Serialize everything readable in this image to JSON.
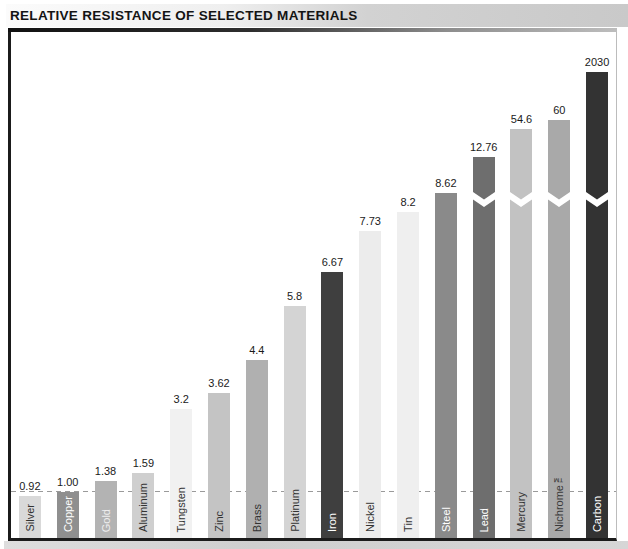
{
  "title": "RELATIVE RESISTANCE OF SELECTED MATERIALS",
  "chart_data": {
    "type": "bar",
    "title": "RELATIVE RESISTANCE OF SELECTED MATERIALS",
    "xlabel": "",
    "ylabel": "",
    "grid": false,
    "legend": "none",
    "reference_line": {
      "value": 1.0,
      "style": "dashed",
      "color": "#9a9a9a"
    },
    "axis_break_note": "bars taller than the frame are drawn with a white zigzag break symbol",
    "categories": [
      "Silver",
      "Copper",
      "Gold",
      "Aluminum",
      "Tungsten",
      "Zinc",
      "Brass",
      "Platinum",
      "Iron",
      "Nickel",
      "Tin",
      "Steel",
      "Lead",
      "Mercury",
      "Nichrome™",
      "Carbon"
    ],
    "values": [
      0.92,
      1.0,
      1.38,
      1.59,
      3.2,
      3.62,
      4.4,
      5.8,
      6.67,
      7.73,
      8.2,
      8.62,
      12.76,
      54.6,
      60,
      2030
    ],
    "bars": [
      {
        "name": "Silver",
        "value_label": "0.92",
        "color": "#d9d9d9",
        "label_color": "#333333",
        "height_px": 42,
        "axis_break": false
      },
      {
        "name": "Copper",
        "value_label": "1.00",
        "color": "#8f8f8f",
        "label_color": "#ffffff",
        "height_px": 46,
        "axis_break": false
      },
      {
        "name": "Gold",
        "value_label": "1.38",
        "color": "#b3b3b3",
        "label_color": "#eeeeee",
        "height_px": 57,
        "axis_break": false
      },
      {
        "name": "Aluminum",
        "value_label": "1.59",
        "color": "#cfcfcf",
        "label_color": "#333333",
        "height_px": 65,
        "axis_break": false
      },
      {
        "name": "Tungsten",
        "value_label": "3.2",
        "color": "#f1f1f1",
        "label_color": "#333333",
        "height_px": 129,
        "axis_break": false
      },
      {
        "name": "Zinc",
        "value_label": "3.62",
        "color": "#c4c4c4",
        "label_color": "#333333",
        "height_px": 145,
        "axis_break": false
      },
      {
        "name": "Brass",
        "value_label": "4.4",
        "color": "#b0b0b0",
        "label_color": "#333333",
        "height_px": 178,
        "axis_break": false
      },
      {
        "name": "Platinum",
        "value_label": "5.8",
        "color": "#d4d4d4",
        "label_color": "#333333",
        "height_px": 232,
        "axis_break": false
      },
      {
        "name": "Iron",
        "value_label": "6.67",
        "color": "#3f3f3f",
        "label_color": "#ffffff",
        "height_px": 266,
        "axis_break": false
      },
      {
        "name": "Nickel",
        "value_label": "7.73",
        "color": "#ececec",
        "label_color": "#333333",
        "height_px": 307,
        "axis_break": false
      },
      {
        "name": "Tin",
        "value_label": "8.2",
        "color": "#efefef",
        "label_color": "#333333",
        "height_px": 326,
        "axis_break": false
      },
      {
        "name": "Steel",
        "value_label": "8.62",
        "color": "#8a8a8a",
        "label_color": "#ffffff",
        "height_px": 345,
        "axis_break": false
      },
      {
        "name": "Lead",
        "value_label": "12.76",
        "color": "#6e6e6e",
        "label_color": "#ffffff",
        "height_px": 381,
        "axis_break": true
      },
      {
        "name": "Mercury",
        "value_label": "54.6",
        "color": "#c2c2c2",
        "label_color": "#333333",
        "height_px": 409,
        "axis_break": true
      },
      {
        "name": "Nichrome™",
        "value_label": "60",
        "color": "#a9a9a9",
        "label_color": "#3a3a3a",
        "height_px": 418,
        "axis_break": true
      },
      {
        "name": "Carbon",
        "value_label": "2030",
        "color": "#333333",
        "label_color": "#ffffff",
        "height_px": 466,
        "axis_break": true
      }
    ]
  }
}
